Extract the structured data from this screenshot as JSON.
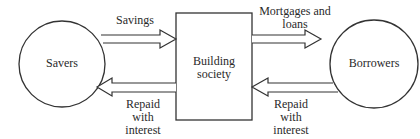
{
  "diagram": {
    "nodes": {
      "savers": {
        "label": "Savers",
        "shape": "circle"
      },
      "building_society": {
        "label_line1": "Building",
        "label_line2": "society",
        "shape": "rectangle"
      },
      "borrowers": {
        "label": "Borrowers",
        "shape": "circle"
      }
    },
    "edges": {
      "savings": {
        "label": "Savings",
        "from": "Savers",
        "to": "Building society"
      },
      "repaid_left": {
        "line1": "Repaid",
        "line2": "with",
        "line3": "interest",
        "from": "Building society",
        "to": "Savers"
      },
      "mortgages": {
        "line1": "Mortgages and",
        "line2": "loans",
        "from": "Building society",
        "to": "Borrowers"
      },
      "repaid_right": {
        "line1": "Repaid",
        "line2": "with",
        "line3": "interest",
        "from": "Borrowers",
        "to": "Building society"
      }
    },
    "colors": {
      "stroke": "#333333",
      "background": "#ffffff"
    }
  }
}
